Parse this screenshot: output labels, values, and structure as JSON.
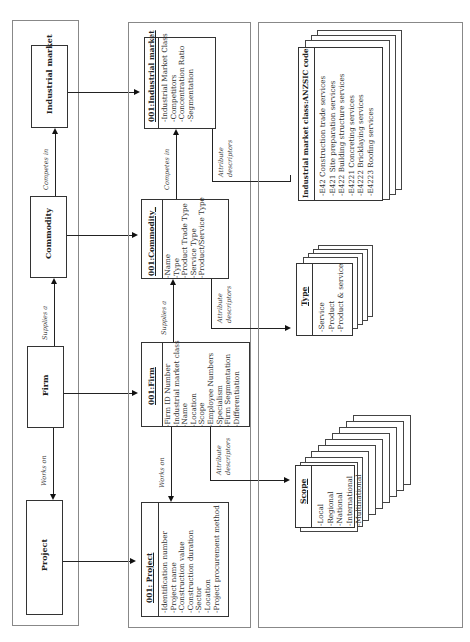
{
  "panels": {
    "concept": {
      "entities": [
        {
          "id": "industrial_market",
          "label": "Industrial market"
        },
        {
          "id": "commodity",
          "label": "Commodity"
        },
        {
          "id": "firm",
          "label": "Firm"
        },
        {
          "id": "project",
          "label": "Project"
        }
      ],
      "relations": [
        {
          "from": "commodity",
          "to": "industrial_market",
          "label": "Competes in"
        },
        {
          "from": "firm",
          "to": "commodity",
          "label": "Supplies a"
        },
        {
          "from": "firm",
          "to": "project",
          "label": "Works on"
        }
      ]
    },
    "instance": {
      "classes": [
        {
          "id": "industrial_market",
          "title": "001:Industrial market",
          "attributes": [
            "-Industrial Market Class",
            "-Competitors",
            "-Concentration Ratio",
            "-Segmentation"
          ]
        },
        {
          "id": "commodity",
          "title": "001:Commodity_",
          "attributes": [
            "-Name",
            "-Type",
            "-Product Trade Type",
            "-Service Type",
            "-Product/Service Type"
          ]
        },
        {
          "id": "firm",
          "title": "001:Firm",
          "attributes": [
            "-Firm ID Number",
            "-Industrial market class",
            "-Name",
            "-Location",
            "-Scope",
            "-Employee Numbers",
            "-Specialism",
            "-Firm Segmentation",
            "-Differentiation"
          ]
        },
        {
          "id": "project",
          "title": "001: Project",
          "attributes": [
            "-Identification number",
            "-Project name",
            "-Construction value",
            "-Construction duration",
            "-Sector",
            "-Location",
            "-Project procurement method"
          ]
        }
      ],
      "relations": [
        {
          "label": "Competes in"
        },
        {
          "label": "Supplies a"
        },
        {
          "label": "Works on"
        }
      ],
      "attribute_descriptors_label": [
        "Attribute",
        "descriptors"
      ]
    },
    "descriptors": {
      "lists": [
        {
          "id": "anzsic",
          "title": "Industrial market class:ANZSIC code",
          "items": [
            "-E42 Construction trade services",
            "-E421 Site preparation services",
            "-E422 Building structure services",
            "-E4221 Concreting services",
            "-E4222 Bricklaying services",
            "-E4223 Roofing services"
          ]
        },
        {
          "id": "type",
          "title": "Type",
          "items": [
            "-Service",
            "-Product",
            "-Product & service"
          ]
        },
        {
          "id": "scope",
          "title": "Scope",
          "items": [
            "-Local",
            "-Regional",
            "-National",
            "-International",
            "-Multinational"
          ]
        }
      ]
    }
  }
}
